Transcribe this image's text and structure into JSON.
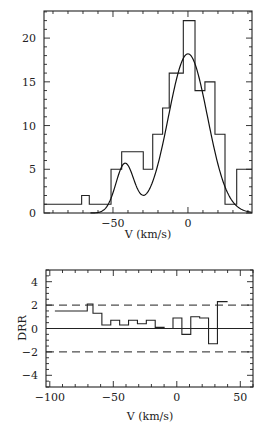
{
  "chart_data": [
    {
      "type": "bar",
      "subtype": "histogram_with_fit",
      "title": "",
      "xlabel": "V (km/s)",
      "ylabel": "",
      "xlim": [
        -96,
        42.7
      ],
      "ylim": [
        0,
        23.1
      ],
      "x_ticks": [
        -50,
        0
      ],
      "y_ticks": [
        0,
        5,
        10,
        15,
        20
      ],
      "grid": false,
      "legend": null,
      "bins": [
        {
          "x0": -96,
          "x1": -70.9,
          "count": 1
        },
        {
          "x0": -70.9,
          "x1": -65.8,
          "count": 2
        },
        {
          "x0": -65.8,
          "x1": -51.3,
          "count": 1
        },
        {
          "x0": -51.3,
          "x1": -44.2,
          "count": 5
        },
        {
          "x0": -44.2,
          "x1": -29.8,
          "count": 7
        },
        {
          "x0": -29.8,
          "x1": -23.5,
          "count": 5
        },
        {
          "x0": -23.5,
          "x1": -16.9,
          "count": 9
        },
        {
          "x0": -16.9,
          "x1": -12.5,
          "count": 12
        },
        {
          "x0": -12.5,
          "x1": -3.1,
          "count": 16
        },
        {
          "x0": -3.1,
          "x1": 4.7,
          "count": 22
        },
        {
          "x0": 4.7,
          "x1": 11.3,
          "count": 14
        },
        {
          "x0": 11.3,
          "x1": 18.0,
          "count": 15
        },
        {
          "x0": 18.0,
          "x1": 24.7,
          "count": 9
        },
        {
          "x0": 24.7,
          "x1": 32.5,
          "count": 1
        },
        {
          "x0": 32.5,
          "x1": 42.7,
          "count": 5
        }
      ],
      "fit": {
        "type": "double-gaussian",
        "components": [
          {
            "amplitude": 18.2,
            "mean": 0,
            "sigma": 13
          },
          {
            "amplitude": 5.6,
            "mean": -42,
            "sigma": 6
          }
        ]
      }
    },
    {
      "type": "line",
      "subtype": "step",
      "title": "",
      "xlabel": "V (km/s)",
      "ylabel": "DRR",
      "xlim": [
        -103,
        60
      ],
      "ylim": [
        -5,
        5
      ],
      "x_ticks": [
        -100,
        -50,
        0,
        50
      ],
      "y_ticks": [
        -4,
        -2,
        0,
        2,
        4
      ],
      "grid": false,
      "legend": null,
      "reference_lines": [
        {
          "y": 0,
          "style": "solid"
        },
        {
          "y": 2,
          "style": "dashed"
        },
        {
          "y": -2,
          "style": "dashed"
        }
      ],
      "steps": [
        {
          "x0": -96,
          "x1": -70.5,
          "y": 1.5
        },
        {
          "x0": -70.5,
          "x1": -66,
          "y": 2.1
        },
        {
          "x0": -66,
          "x1": -59,
          "y": 1.3
        },
        {
          "x0": -59,
          "x1": -52,
          "y": 0.3
        },
        {
          "x0": -52,
          "x1": -45,
          "y": 0.7
        },
        {
          "x0": -45,
          "x1": -38,
          "y": 0.3
        },
        {
          "x0": -38,
          "x1": -31,
          "y": 0.7
        },
        {
          "x0": -31,
          "x1": -24,
          "y": 0.4
        },
        {
          "x0": -24,
          "x1": -17,
          "y": 0.7
        },
        {
          "x0": -17,
          "x1": -10,
          "y": 0.1
        },
        {
          "x0": -10,
          "x1": -3,
          "y": 0.0
        },
        {
          "x0": -3,
          "x1": 4,
          "y": 0.9
        },
        {
          "x0": 4,
          "x1": 11,
          "y": -0.5
        },
        {
          "x0": 11,
          "x1": 18,
          "y": 1.0
        },
        {
          "x0": 18,
          "x1": 25,
          "y": 0.9
        },
        {
          "x0": 25,
          "x1": 32,
          "y": -1.3
        },
        {
          "x0": 32,
          "x1": 40,
          "y": 2.3
        }
      ]
    }
  ],
  "labels": {
    "top_xlabel": "V (km/s)",
    "bottom_xlabel": "V (km/s)",
    "bottom_ylabel": "DRR"
  }
}
